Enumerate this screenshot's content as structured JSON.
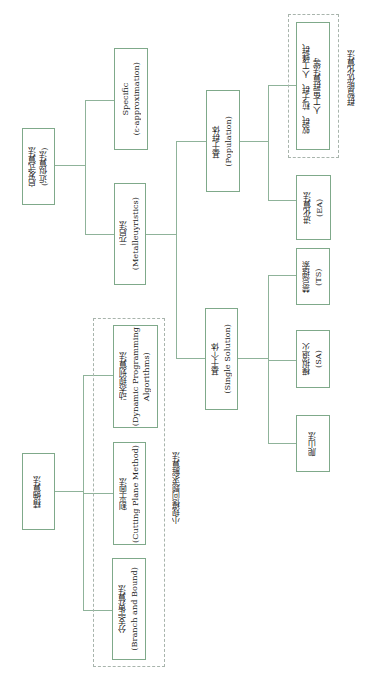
{
  "diagram": {
    "nodes": {
      "heuristic": {
        "line1": "启发式算法",
        "line2": "(近似算法)"
      },
      "specific": {
        "line1": "Specific",
        "line2": "(ε-approximation)"
      },
      "metaheuristic": {
        "line1": "元启法",
        "line2": "(Metalleuyristics)"
      },
      "population": {
        "line1": "基于群体",
        "line2": "(Population)"
      },
      "swarm": {
        "line1": "蚁群、粒子群、人工蜂群、",
        "line2": "人工鱼群算法等"
      },
      "evolutionary": {
        "line1": "进化算法",
        "line2": "(EA)"
      },
      "single": {
        "line1": "基于个体",
        "line2": "(Single Solution)"
      },
      "tabu": {
        "line1": "禁忌搜索",
        "line2": "(TS)"
      },
      "annealing": {
        "line1": "模拟退火",
        "line2": "(SA)"
      },
      "hillclimb": {
        "line1": "爬山法"
      },
      "exact": {
        "line1": "精确算法"
      },
      "dynamic": {
        "line1": "动态规划算法",
        "line2": "(Dynamic Programming",
        "line3": "Algorithms)"
      },
      "cutting": {
        "line1": "割平面法",
        "line2": "(Cutting Plane Method)"
      },
      "branch": {
        "line1": "分支定界算法",
        "line2": "(Branch and Bound)"
      }
    },
    "groups": {
      "swarm_group": "群智能优化算法",
      "small_scale_group": "小规模问题求解算法"
    },
    "colors": {
      "box_border": "#7fa98a",
      "connector": "#8fb39a",
      "dashed": "#a8b4ac"
    }
  }
}
